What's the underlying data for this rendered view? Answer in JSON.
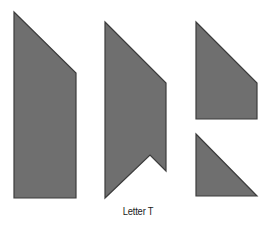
{
  "diagram": {
    "caption": "Letter T",
    "fill_color": "#6f6f6f",
    "stroke_color": "#3c3c3c",
    "pieces": [
      {
        "name": "piece-trapezoid-tall",
        "points": "14,12 76,73 76,198 14,198"
      },
      {
        "name": "piece-notched-pentagon",
        "points": "105,22 166,83 166,171 150,155 105,198"
      },
      {
        "name": "piece-trapezoid-short",
        "points": "196,22 257,83 257,119 196,119"
      },
      {
        "name": "piece-right-triangle",
        "points": "196,134 257,196 196,196"
      }
    ]
  }
}
